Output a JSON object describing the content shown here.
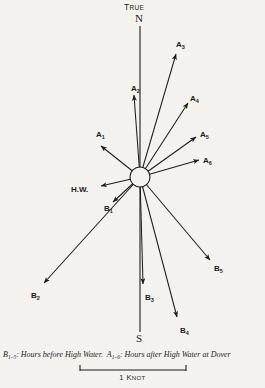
{
  "figure": {
    "type": "tidal-current-rose",
    "background_color": "#f4f2ee",
    "ink_color": "#1d1d1d",
    "true_label_main": "T",
    "true_label_rest": "RUE",
    "north_label": "N",
    "south_label": "S",
    "hub": {
      "cx": 140,
      "cy": 177,
      "r": 10
    }
  },
  "vectors": [
    {
      "id": "A1",
      "base": "A",
      "index": "1",
      "label_x": 96,
      "label_y": 131,
      "tip_x": 101,
      "tip_y": 146,
      "angle_deg": 315,
      "length_px": 53
    },
    {
      "id": "A2",
      "base": "A",
      "index": "2",
      "label_x": 131,
      "label_y": 85,
      "tip_x": 134,
      "tip_y": 95,
      "angle_deg": 356,
      "length_px": 82
    },
    {
      "id": "A3",
      "base": "A",
      "index": "3",
      "label_x": 176,
      "label_y": 41,
      "tip_x": 176,
      "tip_y": 54,
      "angle_deg": 31,
      "length_px": 140
    },
    {
      "id": "A4",
      "base": "A",
      "index": "4",
      "label_x": 190,
      "label_y": 95,
      "tip_x": 188,
      "tip_y": 103,
      "angle_deg": 39,
      "length_px": 95
    },
    {
      "id": "A5",
      "base": "A",
      "index": "5",
      "label_x": 200,
      "label_y": 131,
      "tip_x": 196,
      "tip_y": 137,
      "angle_deg": 55,
      "length_px": 70
    },
    {
      "id": "A6",
      "base": "A",
      "index": "6",
      "label_x": 203,
      "label_y": 157,
      "tip_x": 199,
      "tip_y": 160,
      "angle_deg": 72,
      "length_px": 62
    },
    {
      "id": "B1",
      "base": "B",
      "index": "1",
      "label_x": 104,
      "label_y": 205,
      "tip_x": 113,
      "tip_y": 202,
      "angle_deg": 235,
      "length_px": 33
    },
    {
      "id": "B2",
      "base": "B",
      "index": "2",
      "label_x": 31,
      "label_y": 292,
      "tip_x": 44,
      "tip_y": 283,
      "angle_deg": 228,
      "length_px": 140
    },
    {
      "id": "B3",
      "base": "B",
      "index": "3",
      "label_x": 145,
      "label_y": 294,
      "tip_x": 143,
      "tip_y": 284,
      "angle_deg": 181,
      "length_px": 108
    },
    {
      "id": "B4",
      "base": "B",
      "index": "4",
      "label_x": 180,
      "label_y": 327,
      "tip_x": 177,
      "tip_y": 317,
      "angle_deg": 160,
      "length_px": 146
    },
    {
      "id": "B5",
      "base": "B",
      "index": "5",
      "label_x": 214,
      "label_y": 265,
      "tip_x": 210,
      "tip_y": 260,
      "angle_deg": 126,
      "length_px": 105
    },
    {
      "id": "HW",
      "base": "H.W.",
      "index": "",
      "label_x": 71,
      "label_y": 186,
      "tip_x": 101,
      "tip_y": 186,
      "angle_deg": 266,
      "length_px": 40
    }
  ],
  "caption": {
    "b_symbol": "B",
    "b_range": "1–5",
    "b_text": ": Hours before High Water.  ",
    "a_symbol": "A",
    "a_range": "1–6",
    "a_text": ": Hours after High Water at Dover"
  },
  "scale": {
    "first_char": "1 K",
    "rest": "NOT",
    "left_x": 80,
    "right_x": 186,
    "y": 370
  }
}
